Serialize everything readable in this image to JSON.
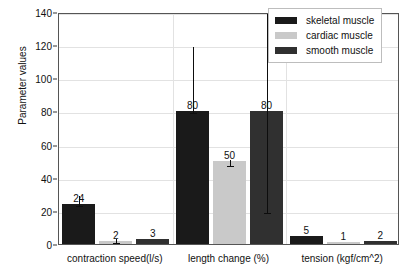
{
  "chart_data": {
    "type": "bar",
    "title": "",
    "xlabel": "",
    "ylabel": "Parameter values",
    "ylim": [
      0,
      140
    ],
    "yticks": [
      0,
      20,
      40,
      60,
      80,
      100,
      120,
      140
    ],
    "grid": true,
    "legend_position": "top-right",
    "categories": [
      "contraction speed(l/s)",
      "length change (%)",
      "tension (kgf/cm^2)"
    ],
    "series": [
      {
        "name": "skeletal muscle",
        "color": "#1a1a1a",
        "values": [
          24,
          80,
          5
        ],
        "errors": [
          {
            "low": 24,
            "high": 30
          },
          {
            "low": 80,
            "high": 120
          },
          {
            "low": 5,
            "high": 5
          }
        ]
      },
      {
        "name": "cardiac muscle",
        "color": "#c9c9c9",
        "values": [
          2,
          50,
          1
        ],
        "errors": [
          {
            "low": 2,
            "high": 4
          },
          {
            "low": 48,
            "high": 52
          },
          {
            "low": 1,
            "high": 1
          }
        ]
      },
      {
        "name": "smooth muscle",
        "color": "#303030",
        "values": [
          3,
          80,
          2
        ],
        "errors": [
          {
            "low": 3,
            "high": 3
          },
          {
            "low": 20,
            "high": 145
          },
          {
            "low": 2,
            "high": 2
          }
        ]
      }
    ],
    "data_labels": [
      [
        "24",
        "2",
        "3"
      ],
      [
        "80",
        "50",
        "80"
      ],
      [
        "5",
        "1",
        "2"
      ]
    ]
  },
  "legend": {
    "items": [
      {
        "label": "skeletal muscle",
        "color": "#1a1a1a"
      },
      {
        "label": "cardiac muscle",
        "color": "#c9c9c9"
      },
      {
        "label": "smooth muscle",
        "color": "#303030"
      }
    ]
  },
  "axis": {
    "y_title": "Parameter values"
  }
}
